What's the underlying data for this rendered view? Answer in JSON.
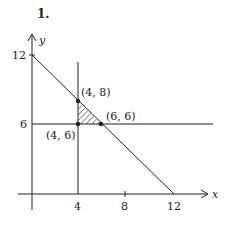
{
  "problem_number": "1.",
  "axes": {
    "x_label": "x",
    "y_label": "y",
    "x_ticks": [
      "4",
      "8",
      "12"
    ],
    "y_ticks": [
      "6",
      "12"
    ]
  },
  "points": [
    {
      "label": "(4, 8)",
      "x": 4,
      "y": 8
    },
    {
      "label": "(6, 6)",
      "x": 6,
      "y": 6
    },
    {
      "label": "(4, 6)",
      "x": 4,
      "y": 6
    }
  ],
  "lines": [
    {
      "equation": "x + y = 12"
    },
    {
      "equation": "x = 4"
    },
    {
      "equation": "y = 6"
    }
  ],
  "shaded_region": "triangle (4,6)-(4,8)-(6,6)",
  "colors": {
    "ink": "#222222",
    "background": "#ffffff"
  }
}
